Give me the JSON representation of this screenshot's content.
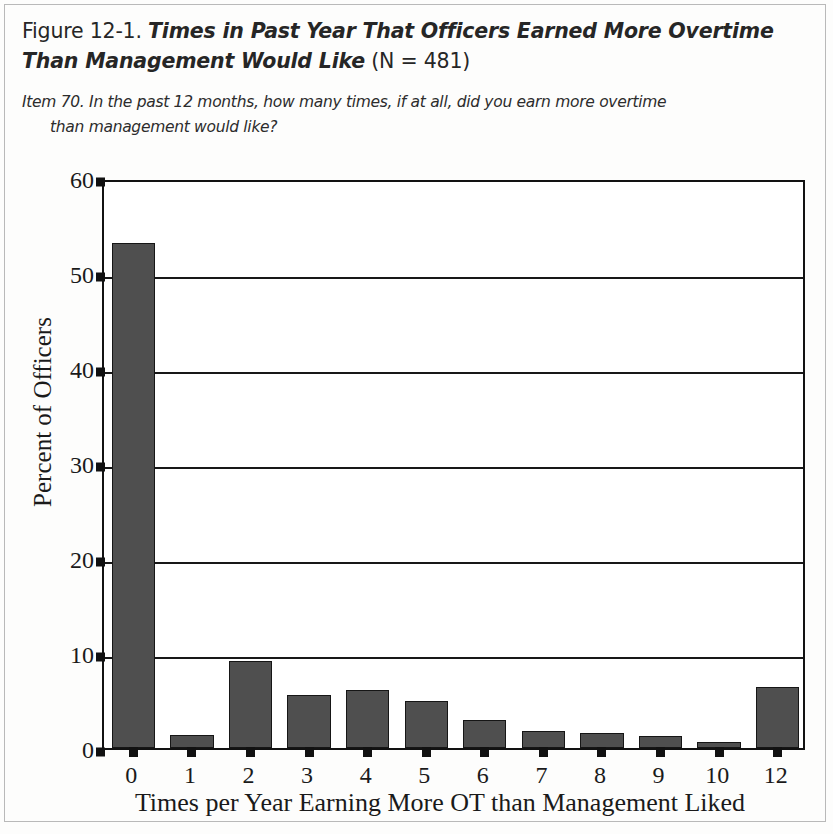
{
  "figure": {
    "number_label": "Figure 12-1.",
    "title": "Times in Past Year That Officers Earned More Overtime Than Management Would Like",
    "n_label": "(N = 481)",
    "item_number": "Item 70.",
    "item_text_line1": "In the past 12 months, how many times, if at all, did you earn more overtime",
    "item_text_line2": "than management would like?"
  },
  "chart_data": {
    "type": "bar",
    "title": "Times in Past Year That Officers Earned More Overtime Than Management Would Like",
    "categories": [
      "0",
      "1",
      "2",
      "3",
      "4",
      "5",
      "6",
      "7",
      "8",
      "9",
      "10",
      "12"
    ],
    "values": [
      53.2,
      1.4,
      9.2,
      5.6,
      6.1,
      5.0,
      3.0,
      1.8,
      1.6,
      1.3,
      0.6,
      6.4
    ],
    "xlabel": "Times per Year Earning More OT than Management Liked",
    "ylabel": "Percent of Officers",
    "ylim": [
      0,
      60
    ],
    "yticks": [
      0,
      10,
      20,
      30,
      40,
      50,
      60
    ],
    "ytick_labels": [
      "0",
      "10",
      "20",
      "30",
      "40",
      "50",
      "60"
    ],
    "grid": "horizontal",
    "legend": "none",
    "bar_color": "#4f4f4f",
    "axis_color": "#121212",
    "n": 481
  }
}
